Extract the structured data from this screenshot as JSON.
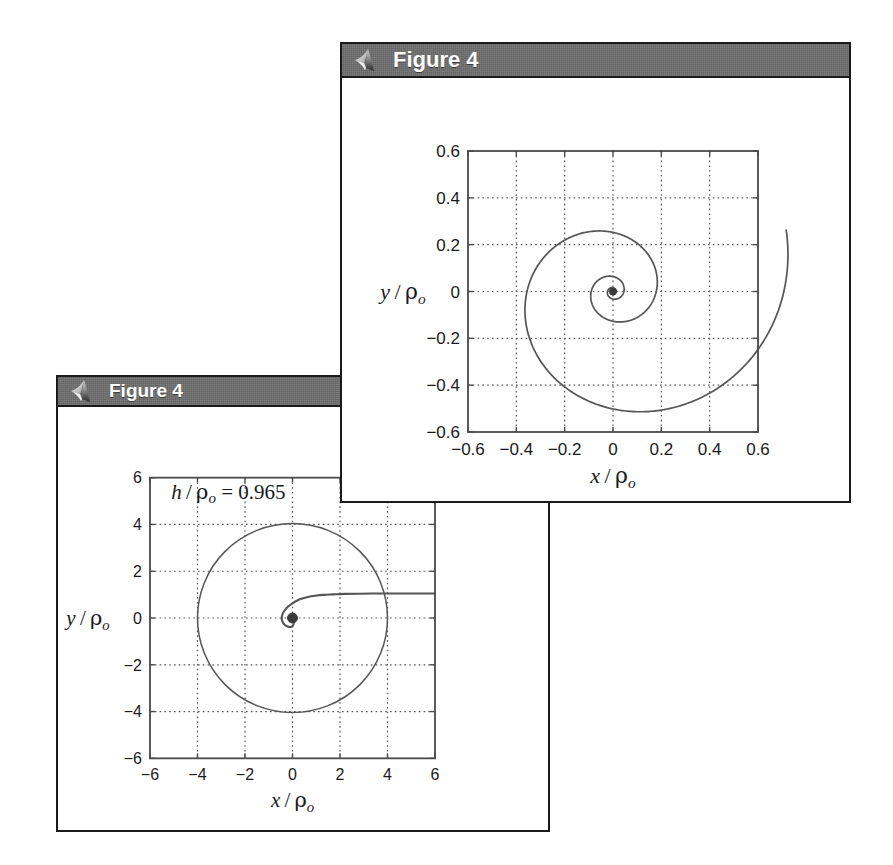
{
  "page": {
    "width": 893,
    "height": 865,
    "background": "#ffffff"
  },
  "colors": {
    "titlebar": "#6e6e6e",
    "titlebar_text": "#ffffff",
    "window_border": "#1a1a1a",
    "axes_line": "#4a4a4a",
    "grid": "#555555",
    "curve": "#555555",
    "marker": "#3a3a3a",
    "tick_label": "#1a1a1a"
  },
  "windows": [
    {
      "id": "figure-4-top",
      "title": "Figure 4",
      "icon": "matlab-membrane-icon",
      "rect": {
        "x": 340,
        "y": 42,
        "width": 511,
        "height": 461
      }
    },
    {
      "id": "figure-4-bottom",
      "title": "Figure 4",
      "icon": "matlab-membrane-icon",
      "rect": {
        "x": 56,
        "y": 375,
        "width": 494,
        "height": 457
      }
    }
  ],
  "chart_data": [
    {
      "id": "top-chart",
      "type": "line",
      "title": "",
      "xlabel": "x / ρₒ",
      "ylabel": "y / ρₒ",
      "xlim": [
        -0.6,
        0.6
      ],
      "ylim": [
        -0.6,
        0.6
      ],
      "xticks": [
        -0.6,
        -0.4,
        -0.2,
        0,
        0.2,
        0.4,
        0.6
      ],
      "xticklabels": [
        "-0.6",
        "-0.4",
        "-0.2",
        "0",
        "0.2",
        "0.4",
        "0.6"
      ],
      "yticks": [
        -0.6,
        -0.4,
        -0.2,
        0,
        0.2,
        0.4,
        0.6
      ],
      "yticklabels": [
        "-0.6",
        "-0.4",
        "-0.2",
        "0",
        "0.2",
        "0.4",
        "0.6"
      ],
      "grid": true,
      "grid_style": "dotted",
      "legend": null,
      "annotations": [],
      "series": [
        {
          "name": "logarithmic-spiral",
          "description": "Inward logarithmic spiral entering from upper region and winding into the origin",
          "spiral": {
            "kind": "logarithmic",
            "a": 0.0115,
            "b": 0.2185,
            "theta_start": -1.0,
            "theta_end": 19.2,
            "center": [
              0.0,
              0.0
            ]
          }
        }
      ],
      "markers": [
        {
          "name": "origin-marker",
          "x": 0,
          "y": 0,
          "size": 5
        }
      ]
    },
    {
      "id": "bottom-chart",
      "type": "line",
      "title": "",
      "xlabel": "x / ρₒ",
      "ylabel": "y / ρₒ",
      "xlim": [
        -6,
        6
      ],
      "ylim": [
        -6,
        6
      ],
      "xticks": [
        -6,
        -4,
        -2,
        0,
        2,
        4,
        6
      ],
      "xticklabels": [
        "-6",
        "-4",
        "-2",
        "0",
        "2",
        "4",
        "6"
      ],
      "yticks": [
        -6,
        -4,
        -2,
        0,
        2,
        4,
        6
      ],
      "yticklabels": [
        "-6",
        "-4",
        "-2",
        "0",
        "2",
        "4",
        "6"
      ],
      "grid": true,
      "grid_style": "dotted",
      "legend": null,
      "annotations": [
        {
          "name": "h-over-rho-annotation",
          "text": "h/ρₒ = 0.965",
          "x": -5.1,
          "y": 5.1
        }
      ],
      "series": [
        {
          "name": "capture-circle",
          "description": "Circle of radius 4 centred on the origin",
          "circle": {
            "cx": 0,
            "cy": 0,
            "r": 4
          }
        },
        {
          "name": "incoming-trajectory",
          "description": "Trajectory entering from the right at y = 1.05, hooking round and spiralling into the origin",
          "points_x": [
            6.0,
            5.2,
            4.4,
            3.6,
            2.8,
            2.2,
            1.7,
            1.3,
            0.95,
            0.65,
            0.4,
            0.18,
            0.0,
            -0.17,
            -0.3,
            -0.4,
            -0.45,
            -0.44,
            -0.38,
            -0.28,
            -0.16,
            -0.05,
            0.02,
            0.05,
            0.04,
            0.01,
            -0.01,
            0.0
          ],
          "points_y": [
            1.05,
            1.05,
            1.05,
            1.05,
            1.04,
            1.03,
            1.01,
            0.99,
            0.95,
            0.9,
            0.83,
            0.74,
            0.63,
            0.5,
            0.36,
            0.21,
            0.05,
            -0.1,
            -0.23,
            -0.33,
            -0.38,
            -0.38,
            -0.32,
            -0.21,
            -0.1,
            -0.03,
            0.0,
            0.0
          ]
        }
      ],
      "markers": [
        {
          "name": "origin-marker",
          "x": 0,
          "y": 0,
          "size": 7
        }
      ]
    }
  ]
}
